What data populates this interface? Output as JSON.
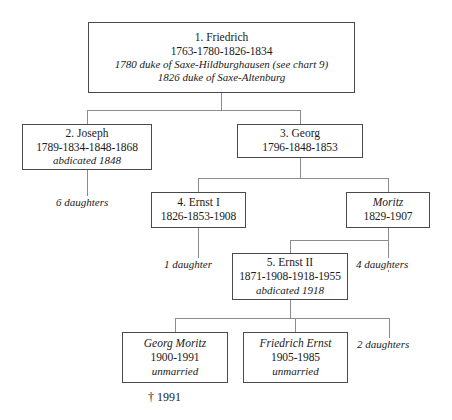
{
  "chart": {
    "nodes": {
      "friedrich": {
        "name": "1. Friedrich",
        "dates": "1763-1780-1826-1834",
        "note1": "1780 duke of Saxe-Hildburghausen (see chart 9)",
        "note2": "1826 duke of Saxe-Altenburg"
      },
      "joseph": {
        "name": "2. Joseph",
        "dates": "1789-1834-1848-1868",
        "note1": "abdicated 1848"
      },
      "georg": {
        "name": "3. Georg",
        "dates": "1796-1848-1853"
      },
      "ernst_i": {
        "name": "4. Ernst I",
        "dates": "1826-1853-1908"
      },
      "moritz": {
        "name": "Moritz",
        "dates": "1829-1907"
      },
      "ernst_ii": {
        "name": "5. Ernst II",
        "dates": "1871-1908-1918-1955",
        "note1": "abdicated 1918"
      },
      "georg_moritz": {
        "name": "Georg Moritz",
        "dates": "1900-1991",
        "note1": "unmarried"
      },
      "friedrich_ernst": {
        "name": "Friedrich Ernst",
        "dates": "1905-1985",
        "note1": "unmarried"
      }
    },
    "labels": {
      "joseph_daughters": "6 daughters",
      "ernst_i_daughter": "1 daughter",
      "moritz_daughters": "4 daughters",
      "ernst_ii_daughters": "2 daughters",
      "line_extinct": "† 1991"
    },
    "colors": {
      "box_border": "#4a4a4a",
      "connector": "#8c8c8c",
      "text": "#1a1a1a",
      "background": "#ffffff"
    }
  }
}
